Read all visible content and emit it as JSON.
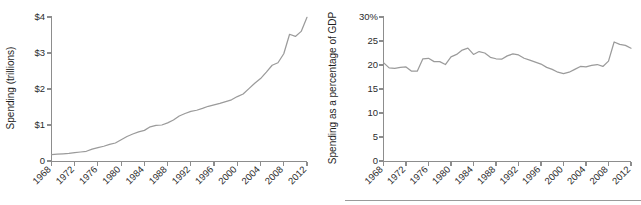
{
  "figure": {
    "panels": [
      {
        "id": "left",
        "name": "total-spending-chart",
        "ylabel": "Spending (trillions)",
        "yticks": [
          "0",
          "$1",
          "$2",
          "$3",
          "$4"
        ],
        "xticks": [
          "1968",
          "1972",
          "1976",
          "1980",
          "1984",
          "1988",
          "1992",
          "1996",
          "2000",
          "2004",
          "2008",
          "2012"
        ],
        "line_color": "#9b9b9b",
        "axis_color": "#8d8d8d"
      },
      {
        "id": "right",
        "name": "spending-pct-gdp-chart",
        "ylabel": "Spending as a percentage of GDP",
        "yticks": [
          "0",
          "5",
          "10",
          "15",
          "20",
          "25",
          "30%"
        ],
        "xticks": [
          "1968",
          "1972",
          "1976",
          "1980",
          "1984",
          "1988",
          "1992",
          "1996",
          "2000",
          "2004",
          "2008",
          "2012"
        ],
        "line_color": "#9b9b9b",
        "axis_color": "#8d8d8d"
      }
    ]
  },
  "chart_data": [
    {
      "type": "line",
      "title": "",
      "xlabel": "",
      "ylabel": "Spending (trillions)",
      "ylim": [
        0,
        4
      ],
      "xlim": [
        1968,
        2012
      ],
      "ytick_values": [
        0,
        1,
        2,
        3,
        4
      ],
      "ytick_labels": [
        "0",
        "$1",
        "$2",
        "$3",
        "$4"
      ],
      "xtick_values": [
        1968,
        1972,
        1976,
        1980,
        1984,
        1988,
        1992,
        1996,
        2000,
        2004,
        2008,
        2012
      ],
      "grid": false,
      "legend": false,
      "series": [
        {
          "name": "Total federal spending (trillions of dollars)",
          "x": [
            1968,
            1969,
            1970,
            1971,
            1972,
            1973,
            1974,
            1975,
            1976,
            1977,
            1978,
            1979,
            1980,
            1981,
            1982,
            1983,
            1984,
            1985,
            1986,
            1987,
            1988,
            1989,
            1990,
            1991,
            1992,
            1993,
            1994,
            1995,
            1996,
            1997,
            1998,
            1999,
            2000,
            2001,
            2002,
            2003,
            2004,
            2005,
            2006,
            2007,
            2008,
            2009,
            2010,
            2011,
            2012
          ],
          "values": [
            0.18,
            0.19,
            0.2,
            0.21,
            0.23,
            0.25,
            0.27,
            0.33,
            0.37,
            0.41,
            0.46,
            0.5,
            0.59,
            0.68,
            0.75,
            0.81,
            0.85,
            0.95,
            0.99,
            1.0,
            1.06,
            1.14,
            1.25,
            1.32,
            1.38,
            1.41,
            1.46,
            1.52,
            1.56,
            1.6,
            1.65,
            1.7,
            1.79,
            1.86,
            2.01,
            2.16,
            2.29,
            2.47,
            2.66,
            2.73,
            2.98,
            3.52,
            3.46,
            3.6,
            3.99
          ]
        }
      ]
    },
    {
      "type": "line",
      "title": "",
      "xlabel": "",
      "ylabel": "Spending as a percentage of GDP",
      "ylim": [
        0,
        30
      ],
      "xlim": [
        1968,
        2012
      ],
      "ytick_values": [
        0,
        5,
        10,
        15,
        20,
        25,
        30
      ],
      "ytick_labels": [
        "0",
        "5",
        "10",
        "15",
        "20",
        "25",
        "30%"
      ],
      "xtick_values": [
        1968,
        1972,
        1976,
        1980,
        1984,
        1988,
        1992,
        1996,
        2000,
        2004,
        2008,
        2012
      ],
      "grid": false,
      "legend": false,
      "series": [
        {
          "name": "Federal spending as a percentage of GDP",
          "x": [
            1968,
            1969,
            1970,
            1971,
            1972,
            1973,
            1974,
            1975,
            1976,
            1977,
            1978,
            1979,
            1980,
            1981,
            1982,
            1983,
            1984,
            1985,
            1986,
            1987,
            1988,
            1989,
            1990,
            1991,
            1992,
            1993,
            1994,
            1995,
            1996,
            1997,
            1998,
            1999,
            2000,
            2001,
            2002,
            2003,
            2004,
            2005,
            2006,
            2007,
            2008,
            2009,
            2010,
            2011,
            2012
          ],
          "values": [
            20.5,
            19.4,
            19.3,
            19.5,
            19.6,
            18.7,
            18.7,
            21.3,
            21.4,
            20.7,
            20.7,
            20.1,
            21.7,
            22.2,
            23.1,
            23.5,
            22.2,
            22.8,
            22.5,
            21.6,
            21.3,
            21.2,
            21.9,
            22.3,
            22.1,
            21.4,
            21.0,
            20.6,
            20.2,
            19.5,
            19.1,
            18.5,
            18.2,
            18.5,
            19.1,
            19.7,
            19.6,
            19.9,
            20.1,
            19.7,
            20.8,
            24.8,
            24.3,
            24.1,
            23.5
          ]
        }
      ]
    }
  ]
}
